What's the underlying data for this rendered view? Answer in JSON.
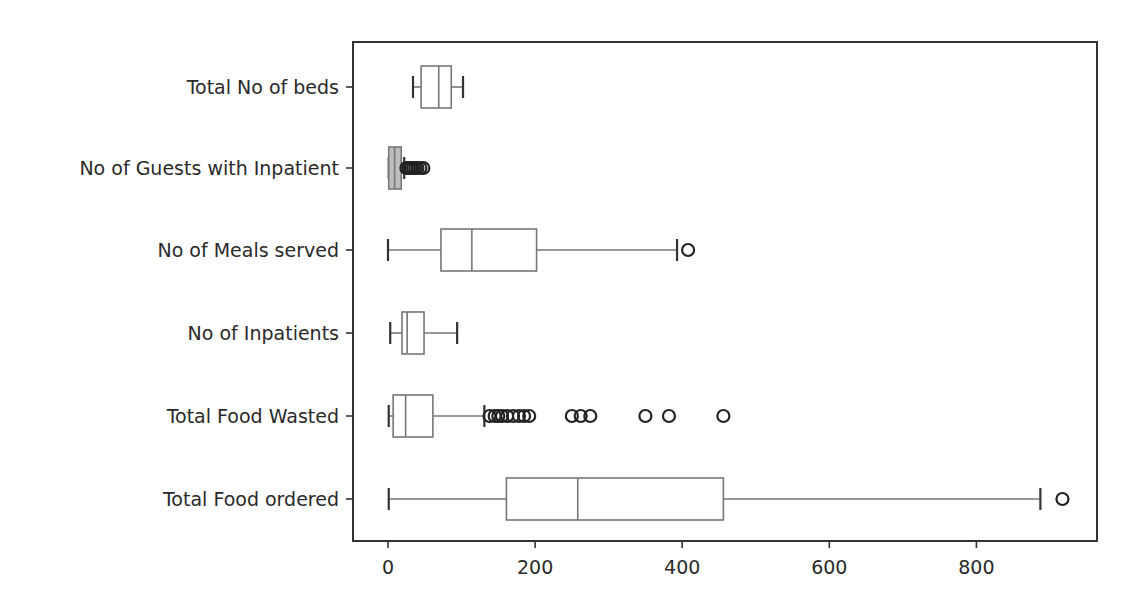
{
  "chart_data": {
    "type": "boxplot",
    "orientation": "horizontal",
    "title": "",
    "xlabel": "",
    "ylabel": "",
    "xlim": [
      -48,
      960
    ],
    "xticks": [
      0,
      200,
      400,
      600,
      800
    ],
    "xtick_labels": [
      "0",
      "200",
      "400",
      "600",
      "800"
    ],
    "grid": false,
    "legend": null,
    "categories": [
      "Total No of beds",
      "No of Guests with Inpatient",
      "No of Meals served",
      "No of Inpatients",
      "Total Food Wasted",
      "Total Food ordered"
    ],
    "series": [
      {
        "name": "Total No of beds",
        "whislo": 34,
        "q1": 45,
        "median": 69,
        "q3": 86,
        "whishi": 102,
        "fliers": []
      },
      {
        "name": "No of Guests with Inpatient",
        "whislo": 1,
        "q1": 1,
        "median": 9,
        "q3": 18,
        "whishi": 22,
        "fliers": [
          25,
          28,
          31,
          34,
          37,
          40,
          44,
          48
        ]
      },
      {
        "name": "No of Meals served",
        "whislo": 0,
        "q1": 72,
        "median": 114,
        "q3": 202,
        "whishi": 393,
        "fliers": [
          408
        ]
      },
      {
        "name": "No of Inpatients",
        "whislo": 3,
        "q1": 19,
        "median": 26,
        "q3": 49,
        "whishi": 94,
        "fliers": []
      },
      {
        "name": "Total Food Wasted",
        "whislo": 1,
        "q1": 7,
        "median": 24,
        "q3": 61,
        "whishi": 131,
        "fliers": [
          138,
          145,
          150,
          155,
          162,
          170,
          178,
          185,
          192,
          250,
          262,
          275,
          350,
          382,
          456
        ]
      },
      {
        "name": "Total Food ordered",
        "whislo": 1,
        "q1": 161,
        "median": 258,
        "q3": 456,
        "whishi": 887,
        "fliers": [
          917
        ]
      }
    ]
  },
  "layout": {
    "plot_left": 353,
    "plot_top": 42,
    "plot_right": 1097,
    "plot_bottom": 541,
    "x0_px": 388,
    "px_per_unit": 0.7355,
    "row_y": [
      87,
      168,
      250,
      333,
      416,
      499
    ],
    "box_half_height": 21,
    "colors": {
      "box": "#777777",
      "axis": "#333333",
      "flier": "#222222",
      "text": "#2a2a2a",
      "guest_fill": "#bdbdbd"
    }
  }
}
